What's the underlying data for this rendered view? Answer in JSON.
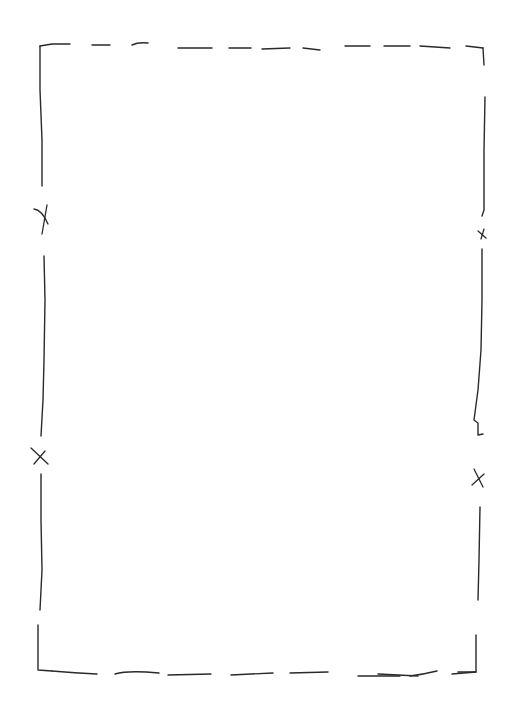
{
  "diagram": {
    "type": "hand-drawn sketch",
    "stroke_color": "#2a2a2a",
    "background_color": "#ffffff",
    "frame": {
      "left": 40,
      "top": 45,
      "right": 485,
      "bottom": 672
    },
    "marks": [
      {
        "side": "left",
        "x": 44,
        "y": 220,
        "symbol": "X"
      },
      {
        "side": "left",
        "x": 40,
        "y": 456,
        "symbol": "X"
      },
      {
        "side": "right",
        "x": 482,
        "y": 234,
        "symbol": "x"
      },
      {
        "side": "right",
        "x": 478,
        "y": 480,
        "symbol": "X"
      }
    ]
  }
}
